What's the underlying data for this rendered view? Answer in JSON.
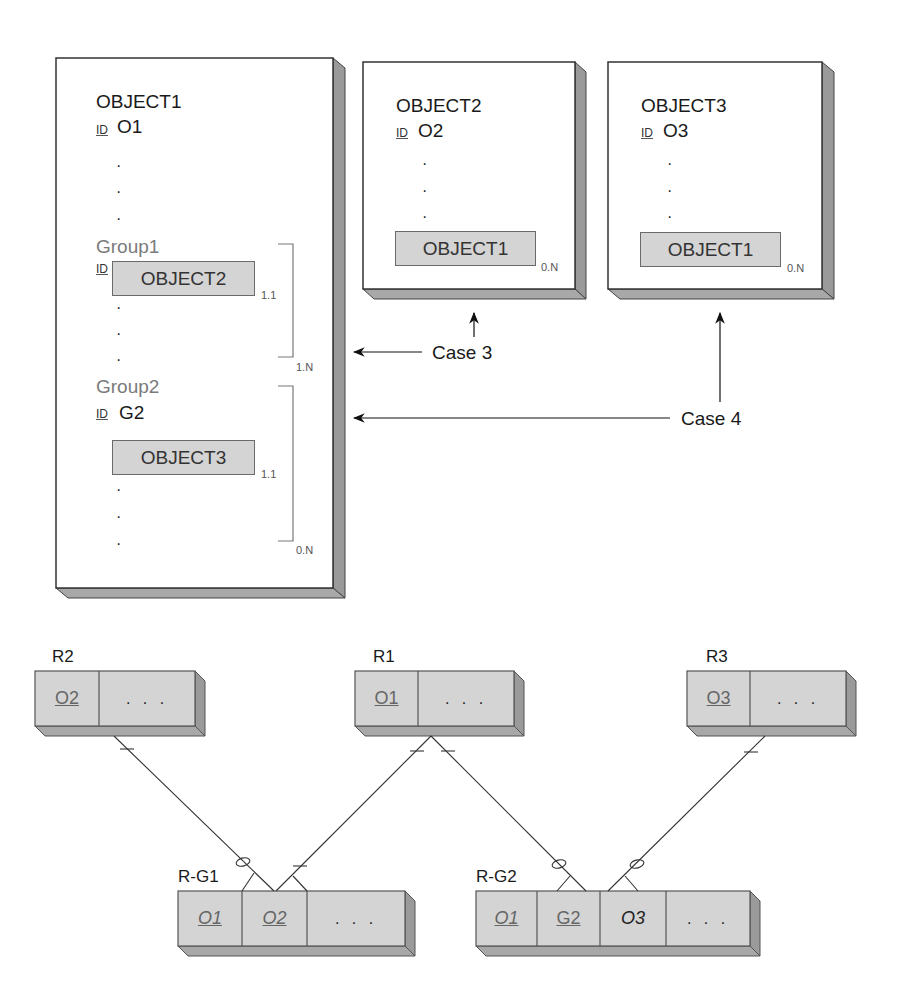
{
  "objects": [
    {
      "name": "OBJECT1",
      "id_tag": "ID",
      "id_value": "O1",
      "dots": [
        "·",
        "·",
        "·"
      ],
      "groups": [
        {
          "name": "Group1",
          "id_tag": "ID",
          "embedded": "OBJECT2",
          "embedded_cardinality": "1.1",
          "group_cardinality": "1.N",
          "dots": [
            "·",
            "·"
          ]
        },
        {
          "name": "Group2",
          "id_tag": "ID",
          "id_value": "G2",
          "embedded": "OBJECT3",
          "embedded_cardinality": "1.1",
          "group_cardinality": "0.N",
          "dots": [
            "·",
            "·",
            "·"
          ]
        }
      ]
    },
    {
      "name": "OBJECT2",
      "id_tag": "ID",
      "id_value": "O2",
      "dots": [
        "·",
        "·",
        "·"
      ],
      "embedded": "OBJECT1",
      "embedded_cardinality": "0.N"
    },
    {
      "name": "OBJECT3",
      "id_tag": "ID",
      "id_value": "O3",
      "dots": [
        "·",
        "·",
        "·"
      ],
      "embedded": "OBJECT1",
      "embedded_cardinality": "0.N"
    }
  ],
  "cases": [
    {
      "label": "Case 3"
    },
    {
      "label": "Case 4"
    }
  ],
  "relations": [
    {
      "name": "R2",
      "columns": [
        {
          "text": "O2",
          "key": true
        },
        {
          "text": ". . ."
        }
      ]
    },
    {
      "name": "R1",
      "columns": [
        {
          "text": "O1",
          "key": true
        },
        {
          "text": ". . ."
        }
      ]
    },
    {
      "name": "R3",
      "columns": [
        {
          "text": "O3",
          "key": true
        },
        {
          "text": ". . ."
        }
      ]
    },
    {
      "name": "R-G1",
      "columns": [
        {
          "text": "O1",
          "key": true,
          "foreign": true
        },
        {
          "text": "O2",
          "key": true,
          "foreign": true
        },
        {
          "text": ". . ."
        }
      ]
    },
    {
      "name": "R-G2",
      "columns": [
        {
          "text": "O1",
          "key": true,
          "foreign": true
        },
        {
          "text": "G2",
          "key": true
        },
        {
          "text": "O3",
          "foreign": true
        },
        {
          "text": ". . ."
        }
      ]
    }
  ],
  "colors": {
    "box_fill": "#d4d4d4",
    "side_fill": "#9a9a9a",
    "border": "#5a5a5a",
    "group_text": "#7a7a7a"
  }
}
